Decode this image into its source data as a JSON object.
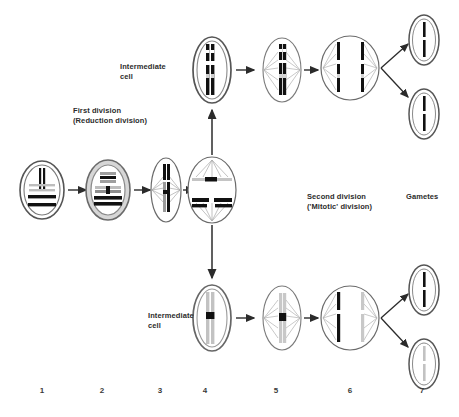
{
  "diagram": {
    "title_labels": {
      "first_division": "First division\n(Reduction division)",
      "intermediate_cell_top": "Intermediate\ncell",
      "intermediate_cell_bottom": "Intermediate\ncell",
      "second_division": "Second division\n('Mitotic' division)",
      "gametes": "Gametes"
    },
    "stage_numbers": [
      "1",
      "2",
      "3",
      "4",
      "5",
      "6",
      "7"
    ],
    "colors": {
      "outline": "#4a4a4a",
      "chromosome_dark": "#111111",
      "chromosome_light": "#b9b9b9",
      "membrane_fill": "#d9d9d9",
      "spindle": "#9a9a9a",
      "arrow": "#2b2b2b",
      "background": "#ffffff"
    },
    "stages": [
      {
        "n": "1",
        "name": "parent-cell-interphase",
        "label": "1"
      },
      {
        "n": "2",
        "name": "prophase-i-pairing",
        "label": "2"
      },
      {
        "n": "3",
        "name": "metaphase-i",
        "label": "3"
      },
      {
        "n": "4",
        "name": "anaphase-i",
        "label": "4"
      },
      {
        "n": "5",
        "name": "metaphase-ii",
        "label": "5"
      },
      {
        "n": "6",
        "name": "anaphase-ii",
        "label": "6"
      },
      {
        "n": "7",
        "name": "gamete",
        "label": "7"
      }
    ]
  }
}
